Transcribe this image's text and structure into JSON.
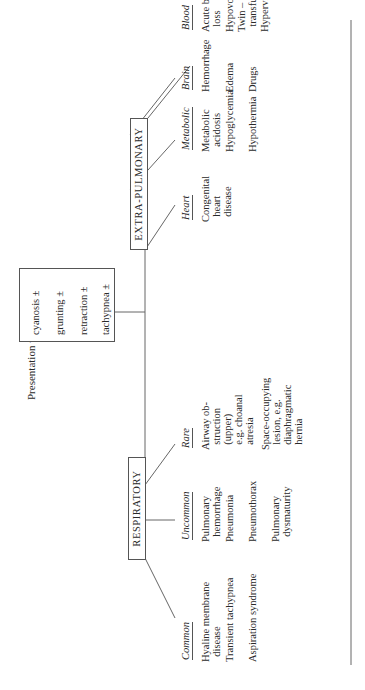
{
  "presentation": {
    "label": "Presentation with –",
    "symptoms": [
      "cyanosis ±",
      "grunting ±",
      "retraction ±",
      "tachypnea ±"
    ]
  },
  "respiratory": {
    "title": "RESPIRATORY",
    "columns": [
      {
        "header": "Common",
        "items": [
          "Hyaline membrane\n  disease",
          "Transient tachypnea",
          "Aspiration syndrome"
        ]
      },
      {
        "header": "Uncommon",
        "items": [
          "Pulmonary\n  hemorrhage",
          "Pneumonia",
          "Pneumothorax",
          "Pulmonary\n  dysmaturity"
        ]
      },
      {
        "header": "Rare",
        "items": [
          "Airway ob-\n  struction\n  (upper)\n  e.g. choanal\n  atresia",
          "Space-occupying\n  lesion, e.g.\n  diaphragmatic\n  hernia"
        ]
      }
    ]
  },
  "extra_pulmonary": {
    "title": "EXTRA-PULMONARY",
    "columns": [
      {
        "header": "Heart",
        "items": [
          "Congenital\n  heart\n  disease"
        ]
      },
      {
        "header": "Metabolic",
        "items": [
          "Metabolic\n  acidosis",
          "Hypoglycemia",
          "Hypothermia"
        ]
      },
      {
        "header": "Brain",
        "items": [
          "Hemorrhage",
          "Edema",
          "Drugs"
        ]
      },
      {
        "header": "Blood",
        "items": [
          "Acute blood\n  loss",
          "Hypovolemia",
          "Twin – Twin\n  transfusion",
          "Hyperviscosity"
        ]
      }
    ]
  }
}
